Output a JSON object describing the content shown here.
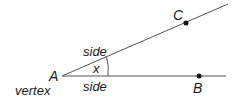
{
  "diagram": {
    "title": "",
    "type": "angle",
    "colors": {
      "line": "#555555",
      "point": "#111111",
      "text": "#1a1a1a"
    },
    "vertex": {
      "label": "A",
      "caption": "vertex",
      "x": 62,
      "y": 76
    },
    "points": [
      {
        "label": "C",
        "x": 186,
        "y": 23
      },
      {
        "label": "B",
        "x": 199,
        "y": 76
      }
    ],
    "rays": [
      {
        "name": "ray-AC",
        "label": "side",
        "x2": 228,
        "y2": 4
      },
      {
        "name": "ray-AB",
        "label": "side",
        "x2": 226,
        "y2": 76
      }
    ],
    "angle": {
      "label": "x"
    }
  }
}
